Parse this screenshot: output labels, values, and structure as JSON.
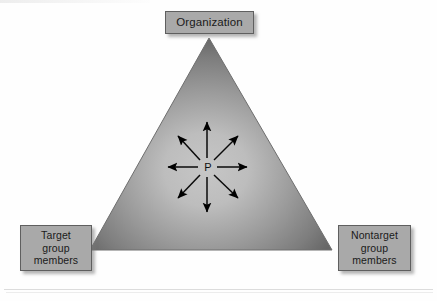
{
  "figure": {
    "type": "triangle-relationship-diagram",
    "width": 437,
    "height": 301,
    "background_color": "#fefefe"
  },
  "triangle": {
    "name": "influence-triangle",
    "apex": {
      "x": 209,
      "y": 38
    },
    "bottom_left": {
      "x": 90,
      "y": 250
    },
    "bottom_right": {
      "x": 332,
      "y": 250
    },
    "edge_color": "#6a6a6a",
    "center_color": "#bdbdbd",
    "gradient": "radial light center to dark edges"
  },
  "center": {
    "label": "P",
    "x": 207,
    "y": 167,
    "color": "#101010"
  },
  "arrows": {
    "count": 8,
    "color": "#000000",
    "directions": [
      "up",
      "up-right",
      "right",
      "down-right",
      "down",
      "down-left",
      "left",
      "up-left"
    ],
    "straight_length": 42,
    "diagonal_length": 42
  },
  "boxes": [
    {
      "id": "organization",
      "label": "Organization",
      "lines": [
        "Organization"
      ],
      "position": "top",
      "fill": "#a9a9a9",
      "border": "#5f5f5f"
    },
    {
      "id": "target-group-members",
      "label": "Target group members",
      "lines": [
        "Target",
        "group",
        "members"
      ],
      "position": "bottom-left",
      "fill": "#a9a9a9",
      "border": "#5f5f5f"
    },
    {
      "id": "nontarget-group-members",
      "label": "Nontarget group members",
      "lines": [
        "Nontarget",
        "group",
        "members"
      ],
      "position": "bottom-right",
      "fill": "#a9a9a9",
      "border": "#5f5f5f"
    }
  ],
  "rules": {
    "bottom_rule_color": "#dcdcdc"
  }
}
